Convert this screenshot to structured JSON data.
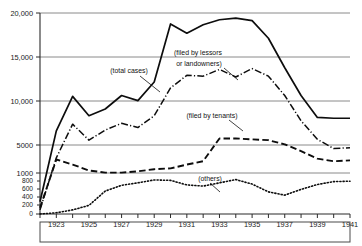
{
  "chart_data": {
    "type": "line",
    "title": "",
    "xlabel": "",
    "ylabel": "",
    "grid": true,
    "legend_position": "inline-annotations",
    "x": [
      1922,
      1923,
      1924,
      1925,
      1926,
      1927,
      1928,
      1929,
      1930,
      1931,
      1932,
      1933,
      1934,
      1935,
      1936,
      1937,
      1938,
      1939,
      1940,
      1941
    ],
    "xticklabels": [
      "1923",
      "1925",
      "1927",
      "1929",
      "1931",
      "1933",
      "1935",
      "1937",
      "1939",
      "1941"
    ],
    "yticklabels": [
      "20,000",
      "15,000",
      "10,000",
      "5000",
      "1000",
      "800",
      "600",
      "400",
      "200",
      "0"
    ],
    "yticks": [
      20000,
      15000,
      10000,
      5000,
      1000,
      800,
      600,
      400,
      200,
      0
    ],
    "y_scale_note": "broken axis: linear 0-1000 compressed at bottom, linear 1000-20000 above",
    "series": [
      {
        "name": "total cases",
        "annotation": "(total cases)",
        "style": "solid",
        "values": [
          300,
          6000,
          10100,
          7800,
          8600,
          10200,
          9600,
          11800,
          18700,
          17600,
          18600,
          19200,
          19400,
          19100,
          17000,
          13500,
          10200,
          7600,
          7500,
          7500
        ]
      },
      {
        "name": "filed by lessors or landowners",
        "annotation": "(filed by lessors or landowners)",
        "style": "dash-dot",
        "values": [
          100,
          2800,
          6800,
          4900,
          6100,
          6900,
          6400,
          7800,
          11100,
          12600,
          12500,
          13300,
          12400,
          13400,
          12500,
          10200,
          7200,
          5000,
          3900,
          4000
        ]
      },
      {
        "name": "filed by tenants",
        "annotation": "(filed by tenants)",
        "style": "dashed",
        "values": [
          150,
          2600,
          2000,
          1300,
          1050,
          1050,
          1200,
          1450,
          1550,
          2000,
          2400,
          5100,
          5100,
          5000,
          4900,
          4400,
          3600,
          2700,
          2400,
          2500
        ]
      },
      {
        "name": "others",
        "annotation": "(others)",
        "style": "dotted",
        "values": [
          0,
          30,
          100,
          210,
          560,
          700,
          760,
          830,
          820,
          710,
          680,
          760,
          840,
          730,
          540,
          460,
          600,
          720,
          790,
          800
        ]
      }
    ]
  },
  "annotations": {
    "total_cases": "(total cases)",
    "lessors_line1": "(filed by lessors",
    "lessors_line2": "or landowners)",
    "tenants": "(filed by tenants)",
    "others": "(others)"
  },
  "axis": {
    "y_labels": [
      "20,000",
      "15,000",
      "10,000",
      "5000",
      "1000",
      "800",
      "600",
      "400",
      "200",
      "0"
    ],
    "x_labels": [
      "1923",
      "1925",
      "1927",
      "1929",
      "1931",
      "1933",
      "1935",
      "1937",
      "1939",
      "1941"
    ]
  }
}
